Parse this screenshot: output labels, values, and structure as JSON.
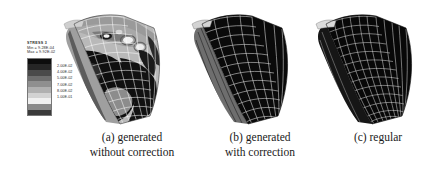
{
  "figure": {
    "background_color": "#ffffff",
    "line_color": "#ffffff",
    "fill_color": "#0a0a0a"
  },
  "legend": {
    "title": "STRESS 3",
    "min_label": "Min = 9.28E-04",
    "max_label": "Max = 9.92E-02",
    "bands": [
      "#0d0d0d",
      "#262626",
      "#4a4a4a",
      "#6e6e6e",
      "#8f8f8f",
      "#b0b0b0",
      "#d2d2d2",
      "#f0f0f0",
      "#8a8a8a",
      "#3a3a3a"
    ],
    "tick_labels": [
      "2.00E-02",
      "4.00E-02",
      "5.00E-02",
      "7.00E-02",
      "8.00E-02",
      "1.00E-01"
    ]
  },
  "panels": [
    {
      "id": "a",
      "name": "generated-without-correction",
      "caption_index": "(a)",
      "caption_line1": "generated",
      "caption_line2": "without correction",
      "mesh_type": "unstructured-irregular",
      "shaded": true
    },
    {
      "id": "b",
      "name": "generated-with-correction",
      "caption_index": "(b)",
      "caption_line1": "generated",
      "caption_line2": "with correction",
      "mesh_type": "unstructured-smoothed",
      "shaded": false
    },
    {
      "id": "c",
      "name": "regular",
      "caption_index": "(c)",
      "caption_line1": "regular",
      "caption_line2": "",
      "mesh_type": "structured-regular",
      "shaded": false
    }
  ],
  "chart_data": {
    "type": "heatmap",
    "title": "STRESS 3",
    "xlabel": "",
    "ylabel": "",
    "legend_position": "left",
    "grid": false,
    "colorbar_min": 0.000928,
    "colorbar_max": 0.0992,
    "tick_values": [
      0.02,
      0.04,
      0.05,
      0.07,
      0.08,
      0.1
    ],
    "tick_labels": [
      "2.00E-02",
      "4.00E-02",
      "5.00E-02",
      "7.00E-02",
      "8.00E-02",
      "1.00E-01"
    ],
    "series": [
      {
        "name": "(a) generated without correction",
        "values": []
      },
      {
        "name": "(b) generated with correction",
        "values": []
      },
      {
        "name": "(c) regular",
        "values": []
      }
    ]
  }
}
